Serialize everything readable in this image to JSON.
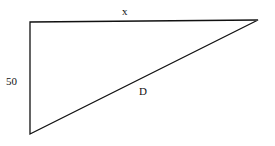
{
  "diagram": {
    "type": "right-triangle",
    "labels": {
      "top_side": "x",
      "left_side": "50",
      "hypotenuse": "D"
    },
    "vertices": {
      "top_left": [
        30,
        22
      ],
      "top_right": [
        258,
        20
      ],
      "bottom_left": [
        30,
        134
      ]
    },
    "stroke_color": "#111111",
    "background": "#ffffff"
  }
}
